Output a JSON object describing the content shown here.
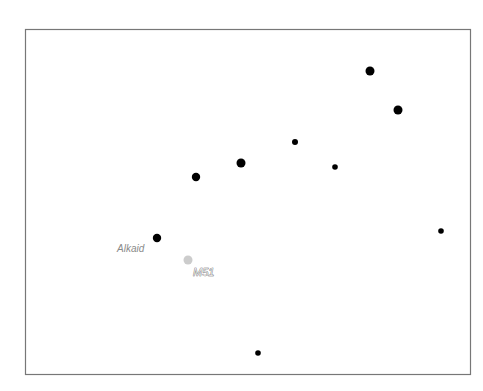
{
  "map": {
    "type": "star-finder-chart",
    "colors": {
      "background": "#ffffff",
      "frame": "#777777",
      "star": "#000000",
      "dso": "#cccccc",
      "star_label": "#8a8a8a"
    },
    "stars": [
      {
        "id": "star-1",
        "magnitude_class": "bright"
      },
      {
        "id": "star-2",
        "magnitude_class": "bright"
      },
      {
        "id": "star-3",
        "magnitude_class": "medium"
      },
      {
        "id": "star-4",
        "magnitude_class": "bright"
      },
      {
        "id": "star-5",
        "magnitude_class": "faint"
      },
      {
        "id": "star-6",
        "magnitude_class": "faint"
      },
      {
        "id": "alkaid",
        "magnitude_class": "medium",
        "label": "Alkaid"
      },
      {
        "id": "star-8",
        "magnitude_class": "faint"
      },
      {
        "id": "star-9",
        "magnitude_class": "faint"
      }
    ],
    "deep_sky_objects": [
      {
        "id": "m51",
        "label": "M51"
      }
    ]
  }
}
